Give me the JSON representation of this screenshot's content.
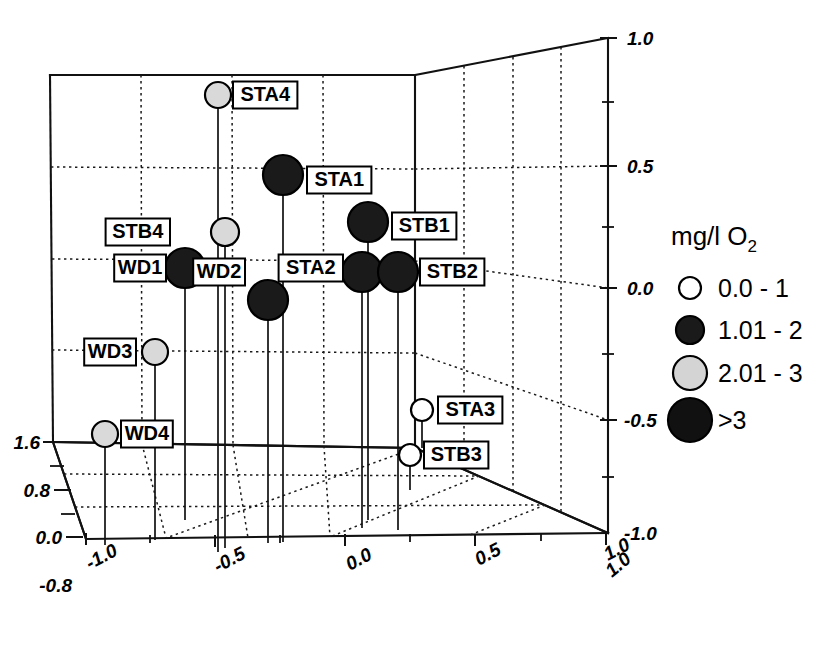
{
  "chart_data": {
    "type": "scatter",
    "title": "",
    "projection": "3d",
    "xlabel": "",
    "ylabel": "",
    "zlabel": "",
    "axes": {
      "x_bottom": {
        "ticks": [
          "-1.0",
          "-0.5",
          "0.0",
          "0.5",
          "1.0"
        ],
        "values": [
          -1.0,
          -0.5,
          0.0,
          0.5,
          1.0
        ],
        "range": [
          -1.0,
          1.0
        ]
      },
      "y_depth": {
        "ticks": [
          "1.0",
          "-1.0"
        ],
        "values": [
          1.0,
          -1.0
        ],
        "range": [
          -1.0,
          1.0
        ]
      },
      "z_right": {
        "ticks": [
          "1.0",
          "0.5",
          "0.0",
          "-0.5",
          "-1.0"
        ],
        "values": [
          1.0,
          0.5,
          0.0,
          -0.5,
          -1.0
        ],
        "range": [
          -1.0,
          1.0
        ]
      },
      "z_left_bubble": {
        "ticks": [
          "1.6",
          "0.8",
          "0.0",
          "-0.8"
        ],
        "values": [
          1.6,
          0.8,
          0.0,
          -0.8
        ]
      }
    },
    "grid": true,
    "legend_position": "right",
    "size_legend": {
      "title": "mg/l O",
      "title_sub": "2",
      "entries": [
        {
          "label": "0.0  - 1",
          "fill": "#ffffff",
          "radius": 11
        },
        {
          "label": "1.01  - 2",
          "fill": "#1a1a1a",
          "radius": 14
        },
        {
          "label": "2.01  - 3",
          "fill": "#d4d4d4",
          "radius": 17
        },
        {
          "label": ">3",
          "fill": "#111111",
          "radius": 22
        }
      ]
    },
    "points": [
      {
        "label": "STA4",
        "px": 218,
        "py": 95,
        "radius": 13,
        "fill": "#d9d9d9",
        "class": "2.01 - 3",
        "label_x": 233,
        "label_y": 95,
        "stem_to": 552
      },
      {
        "label": "STA1",
        "px": 283,
        "py": 175,
        "radius": 20,
        "fill": "#1a1a1a",
        "class": ">3",
        "label_x": 307,
        "label_y": 180,
        "stem_to": 542
      },
      {
        "label": "STB4",
        "px": 225,
        "py": 232,
        "radius": 14,
        "fill": "#d9d9d9",
        "class": "2.01 - 3",
        "label_x": 170,
        "label_y": 232,
        "label_anchor": "end",
        "stem_to": 548
      },
      {
        "label": "STB1",
        "px": 368,
        "py": 222,
        "radius": 20,
        "fill": "#1a1a1a",
        "class": ">3",
        "label_x": 392,
        "label_y": 226,
        "stem_to": 520
      },
      {
        "label": "WD1",
        "px": 185,
        "py": 268,
        "radius": 20,
        "fill": "#1a1a1a",
        "class": ">3",
        "label_x": 166,
        "label_y": 268,
        "label_anchor": "end",
        "stem_to": 520
      },
      {
        "label": "WD2",
        "px": 268,
        "py": 300,
        "radius": 20,
        "fill": "#1a1a1a",
        "class": ">3",
        "label_x": 245,
        "label_y": 272,
        "label_anchor": "end",
        "stem_to": 543
      },
      {
        "label": "STA2",
        "px": 362,
        "py": 272,
        "radius": 20,
        "fill": "#1a1a1a",
        "class": ">3",
        "label_x": 343,
        "label_y": 268,
        "label_anchor": "end",
        "stem_to": 528
      },
      {
        "label": "STB2",
        "px": 398,
        "py": 272,
        "radius": 20,
        "fill": "#1a1a1a",
        "class": ">3",
        "label_x": 420,
        "label_y": 272,
        "stem_to": 530
      },
      {
        "label": "WD3",
        "px": 155,
        "py": 352,
        "radius": 13,
        "fill": "#d9d9d9",
        "class": "2.01 - 3",
        "label_x": 136,
        "label_y": 352,
        "label_anchor": "end",
        "stem_to": 540
      },
      {
        "label": "STA3",
        "px": 422,
        "py": 410,
        "radius": 11,
        "fill": "#ffffff",
        "class": "0.0 - 1",
        "label_x": 438,
        "label_y": 410,
        "stem_to": 448
      },
      {
        "label": "STB3",
        "px": 410,
        "py": 455,
        "radius": 11,
        "fill": "#ffffff",
        "class": "0.0 - 1",
        "label_x": 424,
        "label_y": 455,
        "stem_to": 490
      },
      {
        "label": "WD4",
        "px": 105,
        "py": 434,
        "radius": 13,
        "fill": "#d9d9d9",
        "class": "2.01 - 3",
        "label_x": 121,
        "label_y": 434,
        "stem_to": 545
      }
    ]
  }
}
